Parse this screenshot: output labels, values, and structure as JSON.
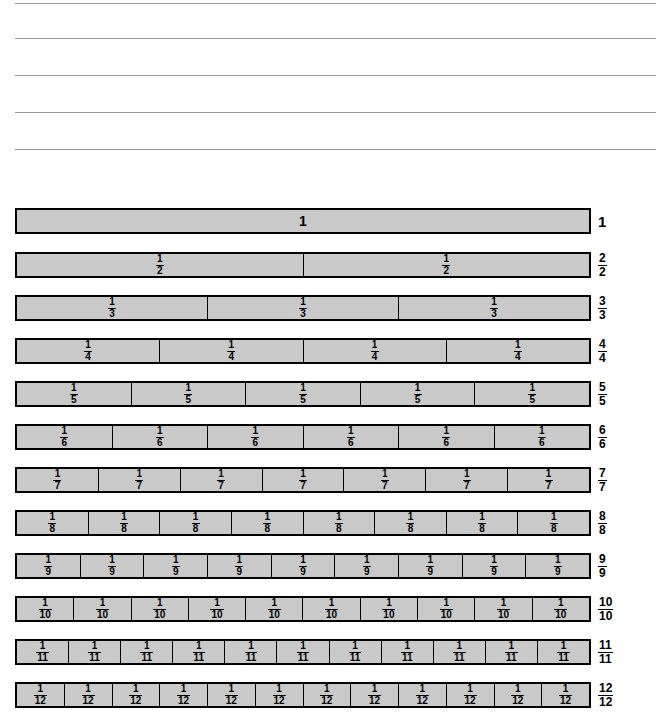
{
  "page": {
    "background_color": "#ffffff",
    "bar_fill_color": "#c9c9c9",
    "bar_border_color": "#000000",
    "rule_line_color": "#9a9a9a"
  },
  "ruled_lines": {
    "count": 5,
    "tops": [
      3,
      38,
      75,
      112,
      149
    ],
    "left": 15
  },
  "chart_data": {
    "type": "bar",
    "xlabel": "",
    "ylabel": "",
    "categories": [
      "1",
      "2",
      "3",
      "4",
      "5",
      "6",
      "7",
      "8",
      "9",
      "10",
      "11",
      "12"
    ],
    "values": [
      1,
      2,
      3,
      4,
      5,
      6,
      7,
      8,
      9,
      10,
      11,
      12
    ],
    "note": "Each row is one unit-length bar divided into n equal parts; every part is labelled 1/n and the whole row is labelled n/n.",
    "rows": [
      {
        "denominator": 1,
        "segments": 1,
        "segment_label_numerator": "1",
        "segment_label_denominator": "",
        "segment_is_whole": true,
        "segment_labels": [
          "1"
        ],
        "row_label_numerator": "1",
        "row_label_denominator": "",
        "row_label_is_whole": true,
        "top": 208
      },
      {
        "denominator": 2,
        "segments": 2,
        "segment_label_numerator": "1",
        "segment_label_denominator": "2",
        "segment_is_whole": false,
        "segment_labels": [
          "1/2",
          "1/2"
        ],
        "row_label_numerator": "2",
        "row_label_denominator": "2",
        "row_label_is_whole": false,
        "top": 252
      },
      {
        "denominator": 3,
        "segments": 3,
        "segment_label_numerator": "1",
        "segment_label_denominator": "3",
        "segment_is_whole": false,
        "segment_labels": [
          "1/3",
          "1/3",
          "1/3"
        ],
        "row_label_numerator": "3",
        "row_label_denominator": "3",
        "row_label_is_whole": false,
        "top": 295
      },
      {
        "denominator": 4,
        "segments": 4,
        "segment_label_numerator": "1",
        "segment_label_denominator": "4",
        "segment_is_whole": false,
        "segment_labels": [
          "1/4",
          "1/4",
          "1/4",
          "1/4"
        ],
        "row_label_numerator": "4",
        "row_label_denominator": "4",
        "row_label_is_whole": false,
        "top": 338
      },
      {
        "denominator": 5,
        "segments": 5,
        "segment_label_numerator": "1",
        "segment_label_denominator": "5",
        "segment_is_whole": false,
        "segment_labels": [
          "1/5",
          "1/5",
          "1/5",
          "1/5",
          "1/5"
        ],
        "row_label_numerator": "5",
        "row_label_denominator": "5",
        "row_label_is_whole": false,
        "top": 381
      },
      {
        "denominator": 6,
        "segments": 6,
        "segment_label_numerator": "1",
        "segment_label_denominator": "6",
        "segment_is_whole": false,
        "segment_labels": [
          "1/6",
          "1/6",
          "1/6",
          "1/6",
          "1/6",
          "1/6"
        ],
        "row_label_numerator": "6",
        "row_label_denominator": "6",
        "row_label_is_whole": false,
        "top": 424
      },
      {
        "denominator": 7,
        "segments": 7,
        "segment_label_numerator": "1",
        "segment_label_denominator": "7",
        "segment_is_whole": false,
        "segment_labels": [
          "1/7",
          "1/7",
          "1/7",
          "1/7",
          "1/7",
          "1/7",
          "1/7"
        ],
        "row_label_numerator": "7",
        "row_label_denominator": "7",
        "row_label_is_whole": false,
        "top": 467
      },
      {
        "denominator": 8,
        "segments": 8,
        "segment_label_numerator": "1",
        "segment_label_denominator": "8",
        "segment_is_whole": false,
        "segment_labels": [
          "1/8",
          "1/8",
          "1/8",
          "1/8",
          "1/8",
          "1/8",
          "1/8",
          "1/8"
        ],
        "row_label_numerator": "8",
        "row_label_denominator": "8",
        "row_label_is_whole": false,
        "top": 510
      },
      {
        "denominator": 9,
        "segments": 9,
        "segment_label_numerator": "1",
        "segment_label_denominator": "9",
        "segment_is_whole": false,
        "segment_labels": [
          "1/9",
          "1/9",
          "1/9",
          "1/9",
          "1/9",
          "1/9",
          "1/9",
          "1/9",
          "1/9"
        ],
        "row_label_numerator": "9",
        "row_label_denominator": "9",
        "row_label_is_whole": false,
        "top": 553
      },
      {
        "denominator": 10,
        "segments": 10,
        "segment_label_numerator": "1",
        "segment_label_denominator": "10",
        "segment_is_whole": false,
        "segment_labels": [
          "1/10",
          "1/10",
          "1/10",
          "1/10",
          "1/10",
          "1/10",
          "1/10",
          "1/10",
          "1/10",
          "1/10"
        ],
        "row_label_numerator": "10",
        "row_label_denominator": "10",
        "row_label_is_whole": false,
        "top": 596
      },
      {
        "denominator": 11,
        "segments": 11,
        "segment_label_numerator": "1",
        "segment_label_denominator": "11",
        "segment_is_whole": false,
        "segment_labels": [
          "1/11",
          "1/11",
          "1/11",
          "1/11",
          "1/11",
          "1/11",
          "1/11",
          "1/11",
          "1/11",
          "1/11",
          "1/11"
        ],
        "row_label_numerator": "11",
        "row_label_denominator": "11",
        "row_label_is_whole": false,
        "top": 639
      },
      {
        "denominator": 12,
        "segments": 12,
        "segment_label_numerator": "1",
        "segment_label_denominator": "12",
        "segment_is_whole": false,
        "segment_labels": [
          "1/12",
          "1/12",
          "1/12",
          "1/12",
          "1/12",
          "1/12",
          "1/12",
          "1/12",
          "1/12",
          "1/12",
          "1/12",
          "1/12"
        ],
        "row_label_numerator": "12",
        "row_label_denominator": "12",
        "row_label_is_whole": false,
        "top": 682
      }
    ]
  }
}
